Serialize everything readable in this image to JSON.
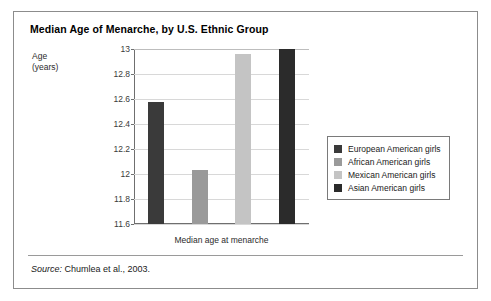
{
  "figure": {
    "title": "Median Age of Menarche, by U.S. Ethnic Group",
    "y_axis_title_line1": "Age",
    "y_axis_title_line2": "(years)",
    "source_label": "Source:",
    "source_text": " Chumlea et al., 2003."
  },
  "chart_data": {
    "type": "bar",
    "title": "Median Age of Menarche, by U.S. Ethnic Group",
    "xlabel": "Median age at menarche",
    "ylabel": "Age (years)",
    "ylim": [
      11.6,
      13.0
    ],
    "yticks": [
      "11.6",
      "11.8",
      "12",
      "12.2",
      "12.4",
      "12.6",
      "12.8",
      "13"
    ],
    "ytick_values": [
      11.6,
      11.8,
      12.0,
      12.2,
      12.4,
      12.6,
      12.8,
      13.0
    ],
    "grid": true,
    "legend_position": "right",
    "categories": [
      "European American girls",
      "African American girls",
      "Mexican American girls",
      "Asian American girls"
    ],
    "values": [
      12.58,
      12.03,
      12.96,
      13.0
    ],
    "colors": [
      "#3a3a3a",
      "#9a9a9a",
      "#c4c4c4",
      "#2b2b2b"
    ]
  }
}
